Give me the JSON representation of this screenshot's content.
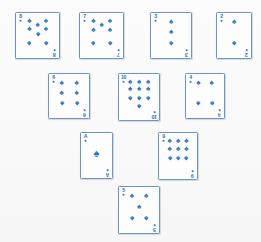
{
  "scene": {
    "title": "Playing card spread",
    "background_color": "#fbfbfb",
    "card_face_color": "#fdfdfe",
    "card_border_color": "#6f93c4",
    "ink_color": "#2f74bd",
    "suit_name": "spades",
    "suit_glyph": "♠",
    "card_count": 10,
    "layout": "inverted-pyramid / diamond"
  },
  "cards": [
    {
      "id": "card-8-spades",
      "rank": "8",
      "rank_label": "8",
      "suit": "spades",
      "suit_glyph": "♠",
      "pip_count": 8,
      "x": 15,
      "y": 12,
      "w": 45,
      "h": 47,
      "pips": [
        {
          "cx": 25,
          "cy": 9,
          "flip": false
        },
        {
          "cx": 75,
          "cy": 9,
          "flip": false
        },
        {
          "cx": 25,
          "cy": 30,
          "flip": false
        },
        {
          "cx": 75,
          "cy": 30,
          "flip": false
        },
        {
          "cx": 50,
          "cy": 19,
          "flip": false
        },
        {
          "cx": 50,
          "cy": 46,
          "flip": true
        },
        {
          "cx": 25,
          "cy": 70,
          "flip": true
        },
        {
          "cx": 75,
          "cy": 70,
          "flip": true
        }
      ]
    },
    {
      "id": "card-7-spades",
      "rank": "7",
      "rank_label": "7",
      "suit": "spades",
      "suit_glyph": "♠",
      "pip_count": 7,
      "x": 79,
      "y": 12,
      "w": 45,
      "h": 47,
      "pips": [
        {
          "cx": 25,
          "cy": 9,
          "flip": false
        },
        {
          "cx": 75,
          "cy": 9,
          "flip": false
        },
        {
          "cx": 25,
          "cy": 33,
          "flip": false
        },
        {
          "cx": 75,
          "cy": 33,
          "flip": false
        },
        {
          "cx": 50,
          "cy": 21,
          "flip": false
        },
        {
          "cx": 25,
          "cy": 70,
          "flip": true
        },
        {
          "cx": 75,
          "cy": 70,
          "flip": true
        }
      ]
    },
    {
      "id": "card-3-spades",
      "rank": "3",
      "rank_label": "3",
      "suit": "spades",
      "suit_glyph": "♠",
      "pip_count": 3,
      "x": 150,
      "y": 12,
      "w": 42,
      "h": 47,
      "pips": [
        {
          "cx": 50,
          "cy": 10,
          "flip": false
        },
        {
          "cx": 50,
          "cy": 40,
          "flip": false
        },
        {
          "cx": 50,
          "cy": 72,
          "flip": true
        }
      ]
    },
    {
      "id": "card-2-spades",
      "rank": "2",
      "rank_label": "2",
      "suit": "spades",
      "suit_glyph": "♠",
      "pip_count": 2,
      "x": 216,
      "y": 12,
      "w": 36,
      "h": 47,
      "pips": [
        {
          "cx": 50,
          "cy": 12,
          "flip": false
        },
        {
          "cx": 50,
          "cy": 72,
          "flip": true
        }
      ]
    },
    {
      "id": "card-6-spades",
      "rank": "6",
      "rank_label": "6",
      "suit": "spades",
      "suit_glyph": "♠",
      "pip_count": 6,
      "x": 48,
      "y": 73,
      "w": 42,
      "h": 46,
      "pips": [
        {
          "cx": 25,
          "cy": 11,
          "flip": false
        },
        {
          "cx": 75,
          "cy": 11,
          "flip": false
        },
        {
          "cx": 25,
          "cy": 41,
          "flip": false
        },
        {
          "cx": 75,
          "cy": 41,
          "flip": false
        },
        {
          "cx": 25,
          "cy": 72,
          "flip": true
        },
        {
          "cx": 75,
          "cy": 72,
          "flip": true
        }
      ]
    },
    {
      "id": "card-10-spades",
      "rank": "10",
      "rank_label": "10",
      "suit": "spades",
      "suit_glyph": "♠",
      "pip_count": 10,
      "x": 118,
      "y": 73,
      "w": 42,
      "h": 48,
      "pips": [
        {
          "cx": 20,
          "cy": 7,
          "flip": false
        },
        {
          "cx": 50,
          "cy": 7,
          "flip": false
        },
        {
          "cx": 80,
          "cy": 7,
          "flip": false
        },
        {
          "cx": 20,
          "cy": 27,
          "flip": false
        },
        {
          "cx": 50,
          "cy": 27,
          "flip": false
        },
        {
          "cx": 80,
          "cy": 27,
          "flip": false
        },
        {
          "cx": 20,
          "cy": 53,
          "flip": true
        },
        {
          "cx": 50,
          "cy": 53,
          "flip": true
        },
        {
          "cx": 80,
          "cy": 53,
          "flip": true
        },
        {
          "cx": 50,
          "cy": 76,
          "flip": true
        }
      ]
    },
    {
      "id": "card-4-spades",
      "rank": "4",
      "rank_label": "4",
      "suit": "spades",
      "suit_glyph": "♠",
      "pip_count": 4,
      "x": 185,
      "y": 73,
      "w": 40,
      "h": 46,
      "pips": [
        {
          "cx": 26,
          "cy": 11,
          "flip": false
        },
        {
          "cx": 74,
          "cy": 11,
          "flip": false
        },
        {
          "cx": 26,
          "cy": 72,
          "flip": true
        },
        {
          "cx": 74,
          "cy": 72,
          "flip": true
        }
      ]
    },
    {
      "id": "card-A-spades",
      "rank": "A",
      "rank_label": "A",
      "suit": "spades",
      "suit_glyph": "♠",
      "pip_count": 1,
      "x": 80,
      "y": 132,
      "w": 33,
      "h": 47,
      "pips": [
        {
          "cx": 50,
          "cy": 44,
          "flip": false,
          "size": "big"
        }
      ]
    },
    {
      "id": "card-9-spades",
      "rank": "9",
      "rank_label": "9",
      "suit": "spades",
      "suit_glyph": "♠",
      "pip_count": 9,
      "x": 158,
      "y": 132,
      "w": 40,
      "h": 48,
      "pips": [
        {
          "cx": 20,
          "cy": 8,
          "flip": false
        },
        {
          "cx": 50,
          "cy": 8,
          "flip": false
        },
        {
          "cx": 80,
          "cy": 8,
          "flip": false
        },
        {
          "cx": 20,
          "cy": 30,
          "flip": false
        },
        {
          "cx": 50,
          "cy": 30,
          "flip": false
        },
        {
          "cx": 80,
          "cy": 30,
          "flip": false
        },
        {
          "cx": 20,
          "cy": 56,
          "flip": true
        },
        {
          "cx": 50,
          "cy": 56,
          "flip": true
        },
        {
          "cx": 80,
          "cy": 56,
          "flip": true
        }
      ]
    },
    {
      "id": "card-5-spades",
      "rank": "5",
      "rank_label": "5",
      "suit": "spades",
      "suit_glyph": "♠",
      "pip_count": 5,
      "x": 118,
      "y": 186,
      "w": 42,
      "h": 48,
      "pips": [
        {
          "cx": 26,
          "cy": 11,
          "flip": false
        },
        {
          "cx": 74,
          "cy": 11,
          "flip": false
        },
        {
          "cx": 50,
          "cy": 41,
          "flip": false
        },
        {
          "cx": 26,
          "cy": 72,
          "flip": true
        },
        {
          "cx": 74,
          "cy": 72,
          "flip": true
        }
      ]
    }
  ]
}
